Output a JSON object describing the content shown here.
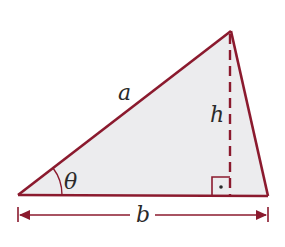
{
  "diagram": {
    "colors": {
      "stroke": "#8b1a2e",
      "fill": "#ececee",
      "text": "#2a2a2a"
    },
    "vertices": {
      "left": [
        18,
        195
      ],
      "apex": [
        231,
        31
      ],
      "right": [
        268,
        196
      ]
    },
    "labels": {
      "side_a": "a",
      "height": "h",
      "angle": "θ",
      "base": "b"
    },
    "annotations": {
      "right_angle_marker": true,
      "height_style": "dashed",
      "base_dimension_arrow": true
    }
  }
}
